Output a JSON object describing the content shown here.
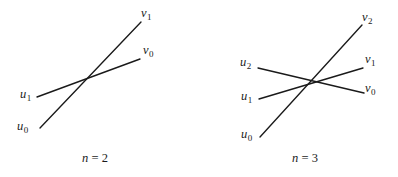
{
  "figure": {
    "background_color": "#ffffff",
    "line_color": "#1a1a1a",
    "text_color": "#1a1a1a",
    "width": 398,
    "height": 177,
    "panels": [
      {
        "id": "left",
        "caption_prefix": "n",
        "caption_equals": "=",
        "caption_value": "2",
        "caption_full": "n = 2",
        "caption_x": 95,
        "caption_y": 152,
        "vertices": [
          {
            "name": "u0",
            "base": "u",
            "sub": "0",
            "label_x": 17,
            "label_y": 120,
            "point_x": 40,
            "point_y": 128
          },
          {
            "name": "u1",
            "base": "u",
            "sub": "1",
            "label_x": 20,
            "label_y": 88,
            "point_x": 37,
            "point_y": 97
          },
          {
            "name": "v0",
            "base": "v",
            "sub": "0",
            "label_x": 143,
            "label_y": 44,
            "point_x": 140,
            "point_y": 59
          },
          {
            "name": "v1",
            "base": "v",
            "sub": "1",
            "label_x": 141,
            "label_y": 7,
            "point_x": 141,
            "point_y": 22
          }
        ],
        "edges": [
          {
            "name": "edge-u0-v1",
            "from": "u0",
            "to": "v1",
            "x1": 40,
            "y1": 128,
            "x2": 141,
            "y2": 22
          },
          {
            "name": "edge-u1-v0",
            "from": "u1",
            "to": "v0",
            "x1": 37,
            "y1": 97,
            "x2": 140,
            "y2": 59
          }
        ]
      },
      {
        "id": "right",
        "caption_prefix": "n",
        "caption_equals": "=",
        "caption_value": "3",
        "caption_full": "n = 3",
        "caption_x": 106,
        "caption_y": 152,
        "vertices": [
          {
            "name": "u0",
            "base": "u",
            "sub": "0",
            "label_x": 42,
            "label_y": 128,
            "point_x": 61,
            "point_y": 137
          },
          {
            "name": "u1",
            "base": "u",
            "sub": "1",
            "label_x": 42,
            "label_y": 90,
            "point_x": 60,
            "point_y": 99
          },
          {
            "name": "u2",
            "base": "u",
            "sub": "2",
            "label_x": 41,
            "label_y": 56,
            "point_x": 59,
            "point_y": 68
          },
          {
            "name": "v0",
            "base": "v",
            "sub": "0",
            "label_x": 166,
            "label_y": 82,
            "point_x": 165,
            "point_y": 93
          },
          {
            "name": "v1",
            "base": "v",
            "sub": "1",
            "label_x": 166,
            "label_y": 53,
            "point_x": 164,
            "point_y": 68
          },
          {
            "name": "v2",
            "base": "v",
            "sub": "2",
            "label_x": 163,
            "label_y": 11,
            "point_x": 163,
            "point_y": 25
          }
        ],
        "edges": [
          {
            "name": "edge-u0-v2",
            "from": "u0",
            "to": "v2",
            "x1": 61,
            "y1": 137,
            "x2": 163,
            "y2": 25
          },
          {
            "name": "edge-u1-v1",
            "from": "u1",
            "to": "v1",
            "x1": 60,
            "y1": 99,
            "x2": 164,
            "y2": 68
          },
          {
            "name": "edge-u2-v0",
            "from": "u2",
            "to": "v0",
            "x1": 59,
            "y1": 68,
            "x2": 165,
            "y2": 93
          }
        ]
      }
    ]
  }
}
